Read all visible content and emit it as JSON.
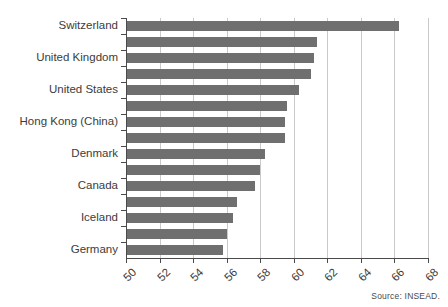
{
  "chart_data": {
    "type": "bar",
    "orientation": "horizontal",
    "title": "",
    "subtitle": "",
    "xlabel": "",
    "ylabel": "",
    "xlim": [
      50,
      68
    ],
    "xticks": [
      50,
      52,
      54,
      56,
      58,
      60,
      62,
      64,
      66,
      68
    ],
    "xtick_labels": [
      "50",
      "52",
      "54",
      "56",
      "58",
      "60",
      "62",
      "64",
      "66",
      "68"
    ],
    "grid": "vertical",
    "legend": "none",
    "bar_color": "#6f6f6f",
    "categories": [
      "Switzerland",
      "",
      "United Kingdom",
      "",
      "United States",
      "",
      "Hong Kong (China)",
      "",
      "Denmark",
      "",
      "Canada",
      "",
      "Iceland",
      "",
      "Germany"
    ],
    "visible_category_labels": [
      "Switzerland",
      "United Kingdom",
      "United States",
      "Hong Kong (China)",
      "Denmark",
      "Canada",
      "Iceland",
      "Germany"
    ],
    "values": [
      66.3,
      61.4,
      61.2,
      61.0,
      60.3,
      59.6,
      59.5,
      59.5,
      58.3,
      58.0,
      57.7,
      56.6,
      56.4,
      56.0,
      55.8
    ],
    "annotations": [
      "Source: INSEAD."
    ]
  },
  "footer": {
    "source_text": "Source: INSEAD."
  }
}
